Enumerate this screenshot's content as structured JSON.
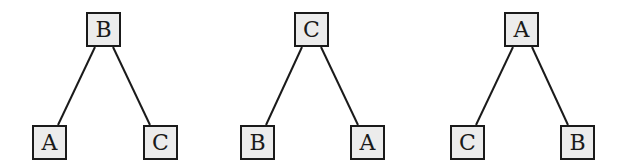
{
  "diagram": {
    "type": "binary-trees",
    "trees": [
      {
        "root": "B",
        "left": "A",
        "right": "C"
      },
      {
        "root": "C",
        "left": "B",
        "right": "A"
      },
      {
        "root": "A",
        "left": "C",
        "right": "B"
      }
    ]
  }
}
